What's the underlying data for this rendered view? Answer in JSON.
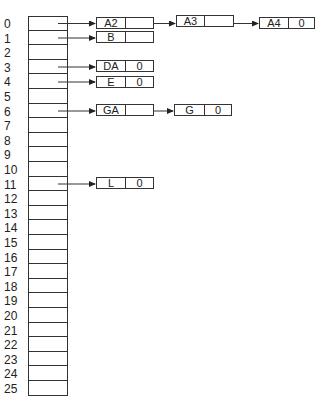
{
  "array": {
    "indices": [
      "0",
      "1",
      "2",
      "3",
      "4",
      "5",
      "6",
      "7",
      "8",
      "9",
      "10",
      "11",
      "12",
      "13",
      "14",
      "15",
      "16",
      "17",
      "18",
      "19",
      "20",
      "21",
      "22",
      "23",
      "24",
      "25"
    ]
  },
  "chains": [
    {
      "index": 0,
      "nodes": [
        {
          "key": "A2",
          "next": ""
        },
        {
          "key": "A3",
          "next": ""
        },
        {
          "key": "A4",
          "next": "0"
        }
      ]
    },
    {
      "index": 1,
      "nodes": [
        {
          "key": "B",
          "next": ""
        }
      ]
    },
    {
      "index": 3,
      "nodes": [
        {
          "key": "DA",
          "next": "0"
        }
      ]
    },
    {
      "index": 4,
      "nodes": [
        {
          "key": "E",
          "next": "0"
        }
      ]
    },
    {
      "index": 6,
      "nodes": [
        {
          "key": "GA",
          "next": ""
        },
        {
          "key": "G",
          "next": "0"
        }
      ]
    },
    {
      "index": 11,
      "nodes": [
        {
          "key": "L",
          "next": "0"
        }
      ]
    }
  ],
  "colors": {
    "line": "#333333",
    "background": "#ffffff"
  }
}
